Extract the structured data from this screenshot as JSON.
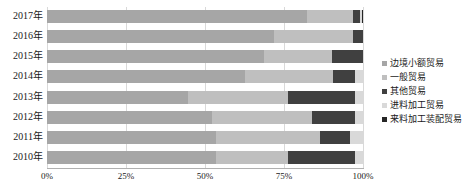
{
  "chart_data": {
    "type": "bar",
    "orientation": "horizontal",
    "stacked": true,
    "stack_mode": "100%",
    "title": "",
    "xlabel": "",
    "ylabel": "",
    "xlim": [
      0,
      100
    ],
    "xticks": [
      "0%",
      "25%",
      "50%",
      "75%",
      "100%"
    ],
    "xtick_values": [
      0,
      25,
      50,
      75,
      100
    ],
    "grid": true,
    "legend_position": "right",
    "categories": [
      "2017年",
      "2016年",
      "2015年",
      "2014年",
      "2013年",
      "2012年",
      "2011年",
      "2010年"
    ],
    "series": [
      {
        "name": "边境小额贸易",
        "color": "#a6a6a6",
        "values": [
          82.3,
          71.8,
          68.7,
          62.7,
          44.6,
          52.2,
          53.5,
          53.5
        ]
      },
      {
        "name": "一般贸易",
        "color": "#bfbfbf",
        "values": [
          14.6,
          25.0,
          21.5,
          27.8,
          31.6,
          31.6,
          33.0,
          22.8
        ]
      },
      {
        "name": "其他贸易",
        "color": "#404040",
        "values": [
          2.2,
          3.2,
          9.8,
          7.0,
          21.2,
          13.6,
          9.5,
          21.2
        ]
      },
      {
        "name": "进料加工贸易",
        "color": "#d9d9d9",
        "values": [
          0.5,
          0.0,
          0.0,
          2.5,
          2.6,
          2.6,
          4.0,
          2.5
        ]
      },
      {
        "name": "来料加工装配贸易",
        "color": "#262626",
        "values": [
          0.4,
          0.0,
          0.0,
          0.0,
          0.0,
          0.0,
          0.0,
          0.0
        ]
      }
    ]
  }
}
